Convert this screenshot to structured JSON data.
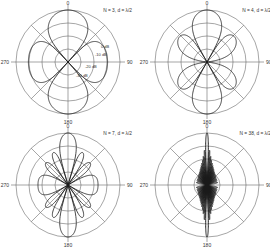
{
  "chart_data": [
    {
      "type": "polar",
      "title": "N = 3, d = λ/2",
      "N": 3,
      "spacing": "λ/2",
      "angle_labels": [
        "0",
        "90",
        "180",
        "270"
      ],
      "radial_scale_db": [
        0,
        -10,
        -20,
        -30
      ],
      "radial_labels": [
        "0 dB",
        "-10 dB",
        "-20 dB",
        "-30 dB"
      ],
      "db_floor": -40,
      "center": [
        68,
        62
      ],
      "radius": 52
    },
    {
      "type": "polar",
      "title": "N = 4, d = λ/2",
      "N": 4,
      "spacing": "λ/2",
      "angle_labels": [
        "0",
        "90",
        "180",
        "270"
      ],
      "radial_scale_db": [
        0,
        -10,
        -20,
        -30
      ],
      "db_floor": -40,
      "center": [
        207,
        62
      ],
      "radius": 52
    },
    {
      "type": "polar",
      "title": "N = 7, d = λ/2",
      "N": 7,
      "spacing": "λ/2",
      "angle_labels": [
        "0",
        "90",
        "180",
        "270"
      ],
      "radial_scale_db": [
        0,
        -10,
        -20,
        -30
      ],
      "db_floor": -40,
      "center": [
        68,
        185
      ],
      "radius": 52
    },
    {
      "type": "polar",
      "title": "N = 38, d = λ/2",
      "N": 38,
      "spacing": "λ/2",
      "angle_labels": [
        "0",
        "90",
        "180",
        "270"
      ],
      "radial_scale_db": [
        0,
        -10,
        -20,
        -30
      ],
      "db_floor": -40,
      "center": [
        207,
        185
      ],
      "radius": 52
    }
  ]
}
